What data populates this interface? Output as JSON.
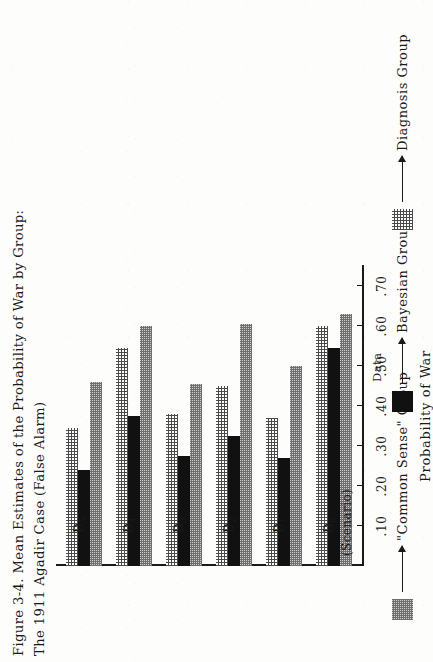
{
  "caption": {
    "text": "Figure 3-4.  Mean Estimates of the Probability of War by Group:\nThe 1911 Agadir Case (False Alarm)"
  },
  "axes": {
    "value_axis_title": "Probability of War",
    "value_ticks": [
      ".70",
      ".60",
      ".50",
      ".40",
      ".30",
      ".20",
      ".10"
    ],
    "category_labels": [
      "D₀\n(Scenario)",
      "D₁",
      "D₂",
      "D₃",
      "D₄",
      "D₅"
    ]
  },
  "legend": {
    "items": [
      {
        "label": "\"Common Sense\" Group",
        "swatch": "mid-grey-halftone-swatch"
      },
      {
        "label": "Bayesian Group",
        "swatch": "black-swatch"
      },
      {
        "label": "Diagnosis Group",
        "swatch": "light-dot-halftone-swatch"
      }
    ],
    "data_note": "Data"
  },
  "chart_data": {
    "type": "bar",
    "orientation": "horizontal",
    "title": "Figure 3-4.  Mean Estimates of the Probability of War by Group: The 1911 Agadir Case (False Alarm)",
    "xlabel": "Probability of War",
    "ylabel": "",
    "xlim": [
      0,
      0.75
    ],
    "xticks": [
      0.1,
      0.2,
      0.3,
      0.4,
      0.5,
      0.6,
      0.7
    ],
    "xticklabels": [
      ".10",
      ".20",
      ".30",
      ".40",
      ".50",
      ".60",
      ".70"
    ],
    "grid": false,
    "legend_position": "bottom",
    "categories": [
      "D0 (Scenario)",
      "D1",
      "D2",
      "D3",
      "D4",
      "D5"
    ],
    "series": [
      {
        "name": "Diagnosis Group",
        "values": [
          0.6,
          0.37,
          0.45,
          0.38,
          0.545,
          0.345
        ]
      },
      {
        "name": "Bayesian Group",
        "values": [
          0.545,
          0.27,
          0.325,
          0.275,
          0.375,
          0.24
        ]
      },
      {
        "name": "\"Common Sense\" Group",
        "values": [
          0.63,
          0.5,
          0.605,
          0.455,
          0.6,
          0.46
        ]
      }
    ]
  }
}
